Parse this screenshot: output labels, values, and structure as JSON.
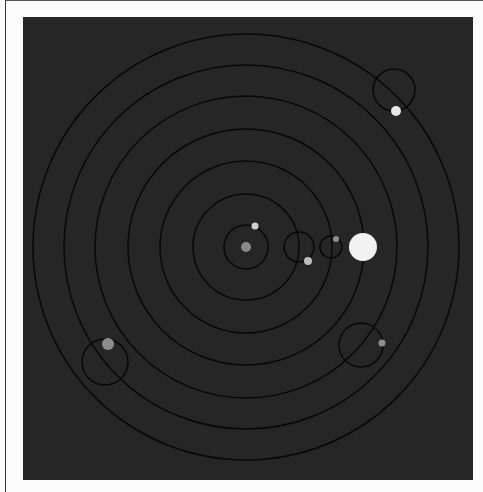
{
  "diagram": {
    "type": "orrery",
    "background": "#262626",
    "center": {
      "x": 246,
      "y": 247
    },
    "orbit_color": "#080808",
    "orbits": [
      22,
      53,
      86,
      118,
      151,
      182,
      213
    ],
    "sun": {
      "x": 363,
      "y": 247,
      "r": 14,
      "color": "#f2f2f2"
    },
    "planets": [
      {
        "name": "planet-1",
        "x": 246,
        "y": 247,
        "r": 5,
        "color": "#8a8a8a",
        "ring": null
      },
      {
        "name": "planet-2",
        "x": 255,
        "y": 226,
        "r": 3.5,
        "color": "#cfcfcf",
        "ring": null
      },
      {
        "name": "planet-3",
        "x": 308,
        "y": 261,
        "r": 4,
        "color": "#bdbdbd",
        "ring": null
      },
      {
        "name": "planet-4",
        "x": 336,
        "y": 239,
        "r": 3,
        "color": "#8f8f8f",
        "ring": null
      },
      {
        "name": "planet-5",
        "x": 396,
        "y": 111,
        "r": 5,
        "color": "#e8e8e8",
        "ring": {
          "cx": 394,
          "cy": 90,
          "r": 21
        }
      },
      {
        "name": "planet-6",
        "x": 108,
        "y": 344,
        "r": 6,
        "color": "#8c8c8c",
        "ring": {
          "cx": 105,
          "cy": 362,
          "r": 23
        }
      },
      {
        "name": "planet-7",
        "x": 382,
        "y": 343,
        "r": 3.5,
        "color": "#8f8f8f",
        "ring": {
          "cx": 361,
          "cy": 345,
          "r": 22
        }
      }
    ],
    "small_rings": [
      {
        "cx": 299,
        "cy": 247,
        "r": 15
      },
      {
        "cx": 331,
        "cy": 247,
        "r": 11
      }
    ]
  }
}
